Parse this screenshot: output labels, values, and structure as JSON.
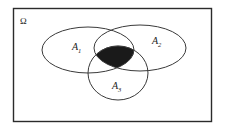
{
  "figure": {
    "universe": {
      "label": "Ω",
      "name": "omega-sample-space"
    },
    "sets": [
      {
        "id": "A1",
        "label": "A",
        "subscript": "1",
        "shape": "ellipse",
        "position": "left"
      },
      {
        "id": "A2",
        "label": "A",
        "subscript": "2",
        "shape": "ellipse",
        "position": "right"
      },
      {
        "id": "A3",
        "label": "A",
        "subscript": "3",
        "shape": "ellipse",
        "position": "bottom"
      }
    ],
    "shaded": {
      "description": "A1 ∩ A2 ∩ A3",
      "fill_color": "#1a1a1a"
    },
    "colors": {
      "background": "#ffffff",
      "curve_stroke": "#3a3a3a",
      "border_stroke": "#2b2b2b",
      "text": "#222222"
    }
  }
}
